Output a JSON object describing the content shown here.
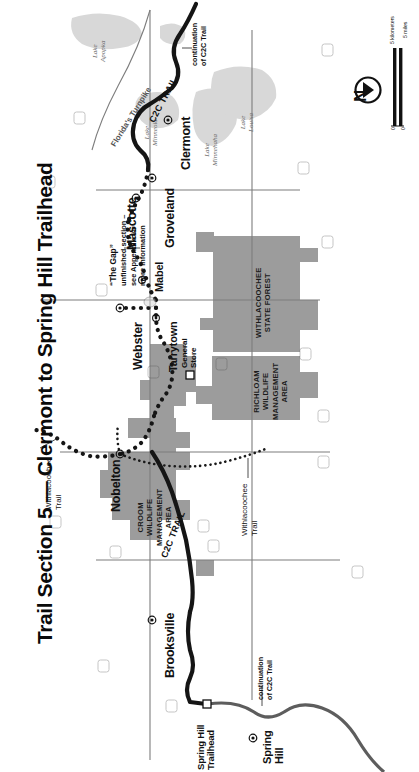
{
  "document": {
    "title": "Trail Section 5 — Clermont to Spring Hill Trailhead",
    "type": "trail-map"
  },
  "map": {
    "places": [
      {
        "name": "Clermont",
        "kind": "city"
      },
      {
        "name": "Mascotte",
        "kind": "city"
      },
      {
        "name": "Groveland",
        "kind": "city"
      },
      {
        "name": "Mabel",
        "kind": "city"
      },
      {
        "name": "Tarrytown",
        "kind": "city"
      },
      {
        "name": "Webster",
        "kind": "city"
      },
      {
        "name": "Nobelton",
        "kind": "city"
      },
      {
        "name": "Brooksville",
        "kind": "city"
      },
      {
        "name": "Spring Hill",
        "kind": "city"
      },
      {
        "name": "Spring Hill\nTrailhead",
        "kind": "trailhead"
      }
    ],
    "city_labels": {
      "clermont": "Clermont",
      "mascotte": "Mascotte",
      "groveland": "Groveland",
      "mabel": "Mabel",
      "tarrytown": "Tarrytown",
      "webster": "Webster",
      "nobelton": "Nobelton",
      "brooksville": "Brooksville",
      "spring_hill": "Spring\nHill",
      "spring_hill_trailhead_line1": "Spring Hill",
      "spring_hill_trailhead_line2": "Trailhead"
    },
    "water": [
      {
        "name": "Lake\nApopka",
        "label_line1": "Lake",
        "label_line2": "Apopka"
      },
      {
        "name": "Lake\nMinneola",
        "label_line1": "Lake",
        "label_line2": "Minneola"
      },
      {
        "name": "Lake\nMinnehaha",
        "label_line1": "Lake",
        "label_line2": "Minnehaha"
      },
      {
        "name": "Lake\nLouisa",
        "label_line1": "Lake",
        "label_line2": "Louisa"
      }
    ],
    "trails": {
      "c2c_trail_upper": "C2C TRAIL",
      "c2c_trail_lower": "C2C TRAIL",
      "withlacoochee_trail_west": "Withlacoochee\nTrail",
      "withlacoochee_trail_west_l1": "Withlacoochee",
      "withlacoochee_trail_west_l2": "Trail",
      "withlacoochee_trail_south": "Withlacoochee\nTrail",
      "withlacoochee_trail_south_l1": "Withlacoochee",
      "withlacoochee_trail_south_l2": "Trail"
    },
    "annotations": {
      "continuation_north_l1": "continuation",
      "continuation_north_l2": "of C2C Trail",
      "continuation_south_l1": "continuation",
      "continuation_south_l2": "of C2C Trail",
      "turnpike": "Florida's Turnpike",
      "gap_title": "“The Gap”",
      "gap_l1": "unfinished section –",
      "gap_l2": "see Appendix for",
      "gap_l3": "more information",
      "general_store_l1": "General",
      "general_store_l2": "Store"
    },
    "public_lands": [
      {
        "name": "WITHLACOOCHEE STATE FOREST",
        "line1": "WITHLACOOCHEE",
        "line2": "STATE FOREST"
      },
      {
        "name": "RICHLOAM WILDLIFE MANAGEMENT AREA",
        "line1": "RICHLOAM",
        "line2": "WILDLIFE",
        "line3": "MANAGEMENT",
        "line4": "AREA"
      },
      {
        "name": "CROOM WILDLIFE MANAGEMENT AREA",
        "line1": "CROOM",
        "line2": "WILDLIFE",
        "line3": "MANAGEMENT",
        "line4": "AREA"
      }
    ],
    "highway_shields": [
      "75",
      "476",
      "50",
      "471",
      "98",
      "41",
      "301",
      "19",
      "565",
      "50"
    ],
    "north_arrow": {
      "letter": "N"
    },
    "scale_bar": {
      "zero_top": "0",
      "zero_bottom": "0",
      "top_label": "5 kilometers",
      "bottom_label": "5 miles"
    },
    "colors": {
      "land_fill": "#9c9c9c",
      "water_fill": "#d8d8d8",
      "trail_paved": "#1a1a1a",
      "trail_unpaved": "#1a1a1a",
      "road": "#6e6e6e",
      "background": "#ffffff"
    }
  }
}
